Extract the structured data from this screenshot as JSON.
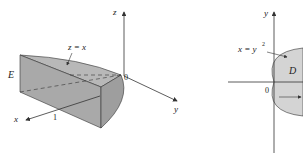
{
  "figure_left": {
    "region_label": "E",
    "surface_label": "z = x",
    "axes": {
      "x": "x",
      "y": "y",
      "z": "z"
    },
    "origin": "0",
    "tick_label": "1",
    "colors": {
      "front": "#a9a9a9",
      "top": "#b8b8b8",
      "side": "#9e9e9e",
      "axis": "#333333"
    }
  },
  "figure_right": {
    "region_label": "D",
    "curve_label": "x = y",
    "curve_exponent": "2",
    "axes": {
      "x": "x",
      "y": "y"
    },
    "origin": "0",
    "colors": {
      "fill": "#d4d4d4",
      "axis": "#333333"
    }
  }
}
